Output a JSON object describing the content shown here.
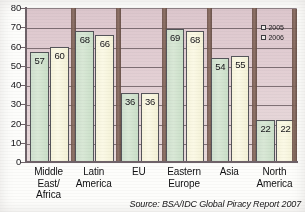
{
  "chart_data": {
    "type": "bar",
    "title": "",
    "xlabel": "",
    "ylabel": "",
    "ylim": [
      0,
      80
    ],
    "yticks": [
      0,
      10,
      20,
      30,
      40,
      50,
      60,
      70,
      80
    ],
    "grid": true,
    "legend_position": "top-right",
    "categories": [
      "Middle East/ Africa",
      "Latin America",
      "EU",
      "Eastern Europe",
      "Asia",
      "North America"
    ],
    "category_lines": [
      [
        "Middle",
        "East/",
        "Africa"
      ],
      [
        "Latin",
        "America"
      ],
      [
        "EU"
      ],
      [
        "Eastern",
        "Europe"
      ],
      [
        "Asia"
      ],
      [
        "North",
        "America"
      ]
    ],
    "series": [
      {
        "name": "2005",
        "values": [
          57,
          68,
          36,
          69,
          54,
          22
        ],
        "color": "#d5e4d2"
      },
      {
        "name": "2006",
        "values": [
          60,
          66,
          36,
          68,
          55,
          22
        ],
        "color": "#f8f6e0"
      }
    ],
    "annotations": [
      "Source: BSA/IDC Global Piracy Report 2007"
    ]
  },
  "legend": {
    "items": [
      {
        "label": "2005"
      },
      {
        "label": "2006"
      }
    ]
  },
  "source": {
    "text": "Source: BSA/IDC Global Piracy Report 2007"
  },
  "colors": {
    "plot_background": "#e0cbd1",
    "gridline": "#6d5f64",
    "axis": "#6e6268",
    "series_2005": "#d5e4d2",
    "series_2006": "#f8f6e0",
    "separator": "#7a5e52",
    "text": "#17161a"
  }
}
